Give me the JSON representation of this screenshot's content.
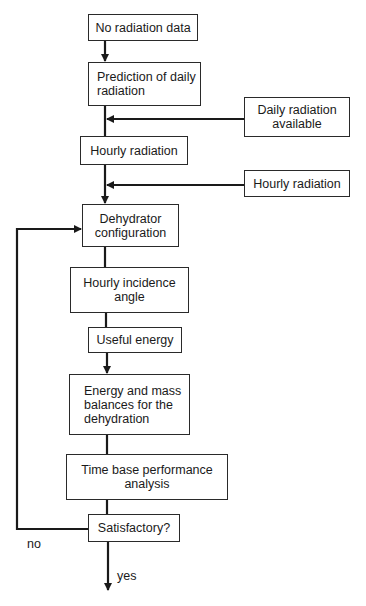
{
  "diagram": {
    "type": "flowchart",
    "nodes": {
      "no_data": "No radiation data",
      "predict_daily": "Prediction of daily radiation",
      "daily_available": "Daily radiation available",
      "hourly_main": "Hourly radiation",
      "hourly_side": "Hourly radiation",
      "config": "Dehydrator configuration",
      "incidence": "Hourly incidence angle",
      "useful": "Useful energy",
      "balances": "Energy and mass balances for the dehydration",
      "performance": "Time base performance analysis",
      "satisfactory": "Satisfactory?"
    },
    "edge_labels": {
      "no": "no",
      "yes": "yes"
    },
    "edges": [
      {
        "from": "no_data",
        "to": "predict_daily"
      },
      {
        "from": "predict_daily",
        "to": "hourly_main"
      },
      {
        "from": "daily_available",
        "to": "predict_daily-hourly_main trunk"
      },
      {
        "from": "hourly_main",
        "to": "config"
      },
      {
        "from": "hourly_side",
        "to": "hourly_main-config trunk"
      },
      {
        "from": "config",
        "to": "incidence"
      },
      {
        "from": "incidence",
        "to": "useful"
      },
      {
        "from": "useful",
        "to": "balances"
      },
      {
        "from": "balances",
        "to": "performance"
      },
      {
        "from": "performance",
        "to": "satisfactory"
      },
      {
        "from": "satisfactory",
        "to": "config",
        "label": "no"
      },
      {
        "from": "satisfactory",
        "to": "exit",
        "label": "yes"
      }
    ]
  }
}
